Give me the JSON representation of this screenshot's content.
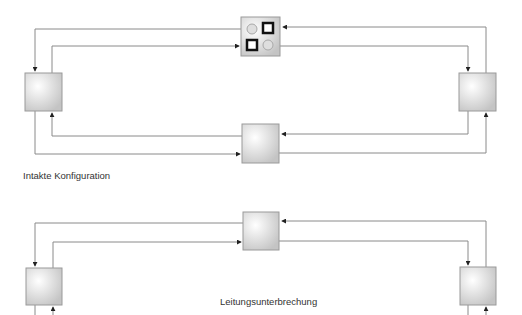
{
  "diagram": {
    "type": "ring-network-redundancy",
    "colors": {
      "line": "#8a8a8a",
      "node_fill_light": "#ffffff",
      "node_fill_dark": "#c8c8c8",
      "switch_port_closed": "#1a1a1a",
      "switch_port_open": "#d0d0d0",
      "text": "#333333"
    },
    "top_configuration": {
      "label": "Intakte Konfiguration",
      "nodes": [
        "left-node",
        "switch-node",
        "right-node",
        "middle-node"
      ],
      "switch_ports": [
        {
          "position": "top-left",
          "state": "open",
          "shape": "circle"
        },
        {
          "position": "top-right",
          "state": "closed",
          "shape": "square"
        },
        {
          "position": "bottom-left",
          "state": "closed",
          "shape": "square"
        },
        {
          "position": "bottom-right",
          "state": "open",
          "shape": "circle"
        }
      ]
    },
    "bottom_configuration": {
      "label": "Leitungsunterbrechung",
      "nodes": [
        "left-node",
        "middle-node",
        "right-node"
      ]
    }
  }
}
